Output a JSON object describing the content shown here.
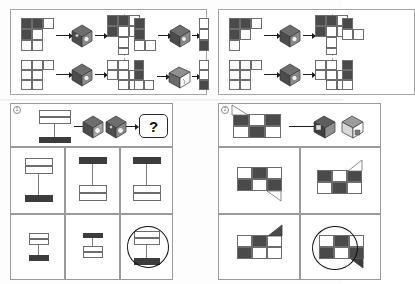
{
  "document": {
    "kind": "spatial-reasoning-worksheet",
    "description": "Scanned printed worksheet page with four framed cube-folding puzzle panels",
    "background_color": "#fdfdfd",
    "ink_color": "#1a1a1a",
    "fill_dark": "#4a4a4a",
    "fill_light": "#ffffff",
    "frame_color": "#9a9a9a"
  },
  "panels": [
    {
      "id": "top-left",
      "label": "",
      "type": "worked-examples",
      "divider": "dashed-vertical",
      "examples": [
        {
          "slot": "upper-left",
          "net_before": {
            "kind": "square-net",
            "rows": 3,
            "cols": 3,
            "cells": [
              "dark",
              "dark",
              "light",
              "dark",
              "ghost",
              "ghost",
              "light",
              "light",
              "ghost"
            ]
          },
          "cube": "isometric-cube-shaded",
          "net_after": {
            "kind": "square-net",
            "rows": 3,
            "cols": 3,
            "cells": [
              "dark",
              "dark",
              "light",
              "dark",
              "light",
              "light",
              "ghost",
              "light",
              "light"
            ]
          },
          "arrow_count": 2
        },
        {
          "slot": "lower-left",
          "net_before": {
            "kind": "square-net",
            "rows": 3,
            "cols": 3,
            "cells": [
              "light",
              "light",
              "light",
              "light",
              "light",
              "light",
              "light",
              "light",
              "ghost"
            ]
          },
          "cube": "isometric-cube-shaded",
          "net_after": {
            "kind": "square-net",
            "rows": 3,
            "cols": 3,
            "cells": [
              "light",
              "light",
              "ghost",
              "light",
              "light",
              "light",
              "ghost",
              "light",
              "light"
            ]
          },
          "arrow_count": 2
        },
        {
          "slot": "upper-right",
          "net_before": {
            "kind": "square-net",
            "rows": 3,
            "cols": 2,
            "cells": [
              "dark",
              "ghost",
              "dark",
              "ghost",
              "light",
              "light"
            ]
          },
          "cube": "isometric-cube-shaded",
          "net_after": {
            "kind": "square-net",
            "rows": 3,
            "cols": 2,
            "cells": [
              "light",
              "light",
              "light",
              "dark",
              "ghost",
              "dark"
            ]
          },
          "arrow_count": 2
        },
        {
          "slot": "lower-right",
          "net_before": {
            "kind": "square-net",
            "rows": 3,
            "cols": 2,
            "cells": [
              "dark",
              "ghost",
              "dark",
              "ghost",
              "light",
              "dark"
            ]
          },
          "cube": "isometric-cube-outline",
          "net_after": {
            "kind": "square-net",
            "rows": 3,
            "cols": 2,
            "cells": [
              "light",
              "ghost",
              "light",
              "light",
              "dark",
              "dark"
            ]
          },
          "arrow_count": 2
        }
      ]
    },
    {
      "id": "top-right",
      "label": "",
      "type": "worked-examples",
      "divider": "dashed-vertical",
      "examples": [
        {
          "slot": "upper-left",
          "net_before": {
            "kind": "square-net",
            "rows": 3,
            "cols": 3,
            "cells": [
              "dark",
              "dark",
              "light",
              "dark",
              "light",
              "ghost",
              "light",
              "ghost",
              "ghost"
            ]
          },
          "cube": "isometric-cube-shaded",
          "net_after": {
            "kind": "square-net",
            "rows": 3,
            "cols": 3,
            "cells": [
              "dark",
              "dark",
              "light",
              "dark",
              "light",
              "light",
              "ghost",
              "light",
              "light"
            ]
          },
          "arrow_count": 2
        },
        {
          "slot": "lower-left",
          "net_before": {
            "kind": "square-net",
            "rows": 3,
            "cols": 3,
            "cells": [
              "light",
              "light",
              "light",
              "light",
              "light",
              "light",
              "light",
              "light",
              "ghost"
            ]
          },
          "cube": "isometric-cube-shaded",
          "net_after": {
            "kind": "square-net",
            "rows": 3,
            "cols": 3,
            "cells": [
              "light",
              "light",
              "ghost",
              "light",
              "light",
              "light",
              "ghost",
              "light",
              "light"
            ]
          },
          "arrow_count": 2
        },
        {
          "slot": "upper-right",
          "net_before": {
            "kind": "square-net",
            "rows": 3,
            "cols": 2,
            "cells": [
              "dark",
              "ghost",
              "light",
              "light",
              "light",
              "ghost"
            ]
          },
          "cube": "",
          "net_after": {
            "kind": "square-net",
            "rows": 3,
            "cols": 2,
            "cells": [
              "light",
              "light",
              "dark",
              "light",
              "ghost",
              "ghost"
            ]
          },
          "arrow_count": 0
        },
        {
          "slot": "lower-right",
          "net_before": {
            "kind": "square-net",
            "rows": 3,
            "cols": 2,
            "cells": [
              "dark",
              "ghost",
              "dark",
              "light",
              "light",
              "ghost"
            ]
          },
          "cube": "",
          "net_after": {
            "kind": "square-net",
            "rows": 3,
            "cols": 2,
            "cells": [
              "light",
              "light",
              "light",
              "dark",
              "ghost",
              "ghost"
            ]
          },
          "arrow_count": 0
        }
      ]
    },
    {
      "id": "bottom-left",
      "label": "1",
      "type": "question",
      "prompt": {
        "net": {
          "kind": "bar-net",
          "description": "tall rectangular net: open top bar, thin vertical stem, solid dark bottom bar"
        },
        "cubes": [
          "isometric-cube-shaded",
          "isometric-cube-shaded"
        ],
        "arrow_count": 3,
        "answer_placeholder": "?"
      },
      "options": [
        {
          "index": "A",
          "shape": "tall-net-open-top-dark-bottom",
          "selected": false
        },
        {
          "index": "B",
          "shape": "dark-top-bar-stem-open-bottom-box",
          "selected": false
        },
        {
          "index": "C",
          "shape": "dark-top-bar-stem-open-lower-bars",
          "selected": false
        },
        {
          "index": "D",
          "shape": "small-open-box-dark-bottom",
          "selected": false
        },
        {
          "index": "E",
          "shape": "small-dark-bar-over-open-bars",
          "selected": false
        },
        {
          "index": "F",
          "shape": "open-box-with-dark-bottom-circled",
          "selected": true
        }
      ]
    },
    {
      "id": "bottom-right",
      "label": "2",
      "type": "question",
      "prompt": {
        "net": {
          "kind": "checker-net",
          "rows": 2,
          "cols": 3,
          "cells": [
            "dark",
            "light",
            "dark",
            "light",
            "dark",
            "light"
          ],
          "flap": "triangle-upper-left"
        },
        "cubes": [
          "isometric-cube-shaded",
          "isometric-cube-outline"
        ],
        "arrow_count": 1
      },
      "options": [
        {
          "index": "A",
          "shape": "checker-2x3-flap-bottom-right",
          "cells": [
            "light",
            "dark",
            "light",
            "dark",
            "light",
            "dark"
          ],
          "selected": false
        },
        {
          "index": "B",
          "shape": "checker-2x3-flap-upper-right",
          "cells": [
            "dark",
            "light",
            "dark",
            "light",
            "dark",
            "light"
          ],
          "selected": false
        },
        {
          "index": "C",
          "shape": "checker-2x3-flap-top-right-filled",
          "cells": [
            "light",
            "dark",
            "light",
            "dark",
            "light",
            "light"
          ],
          "selected": false
        },
        {
          "index": "D",
          "shape": "checker-2x3-flap-bottom-right-circled",
          "cells": [
            "light",
            "dark",
            "light",
            "dark",
            "light",
            "dark"
          ],
          "selected": true
        }
      ]
    }
  ],
  "glyphs": {
    "question_mark": "?",
    "label_one": "1",
    "label_two": "2"
  }
}
